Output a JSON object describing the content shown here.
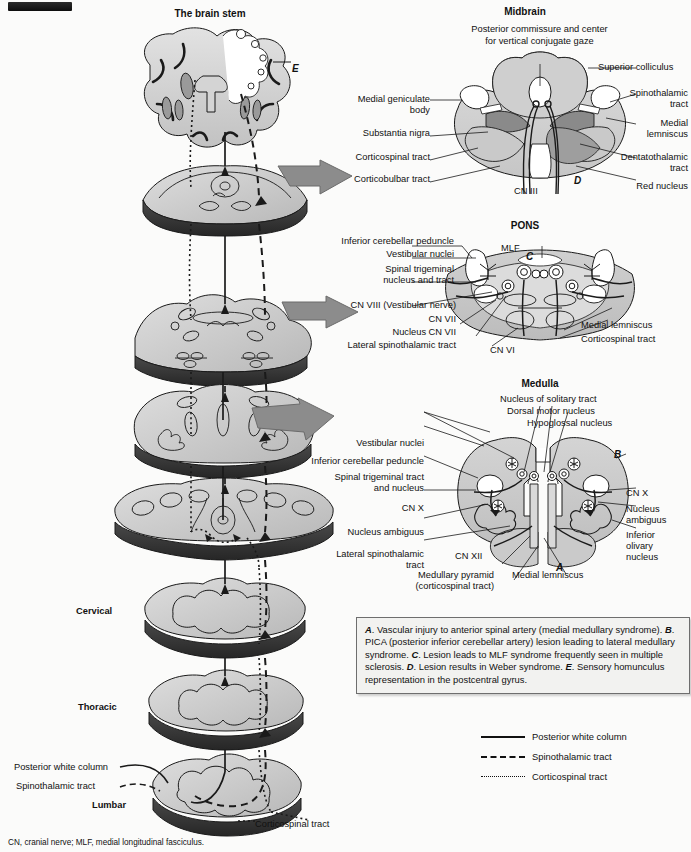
{
  "figure": {
    "brainstem_title": "The brain stem",
    "footnote": "CN, cranial nerve; MLF, medial longitudinal fasciculus."
  },
  "brainstem_column": {
    "marker_E": "E",
    "level_labels": [
      "Cervical",
      "Thoracic",
      "Lumbar"
    ],
    "tract_callouts": [
      "Posterior white column",
      "Spinothalamic tract",
      "Corticospinal tract"
    ]
  },
  "midbrain": {
    "title": "Midbrain",
    "top_label": "Posterior commissure and center\nfor vertical conjugate gaze",
    "left_labels": [
      "Medial geniculate\nbody",
      "Substantia nigra",
      "Corticospinal tract",
      "Corticobulbar tract"
    ],
    "right_labels": [
      "Superior colliculus",
      "Spinothalamic\ntract",
      "Medial\nlemniscus",
      "Dentatothalamic\ntract",
      "Red nucleus"
    ],
    "bottom_label": "CN III",
    "marker": "D"
  },
  "pons": {
    "title": "PONS",
    "left_labels": [
      "Inferior cerebellar peduncle",
      "Vestibular nuclei",
      "Spinal trigeminal\nnucleus and tract",
      "CN VIII (Vestibular nerve)",
      "CN VII",
      "Nucleus CN VII",
      "Lateral spinothalamic tract"
    ],
    "right_labels": [
      "Medial lemniscus",
      "Corticospinal tract"
    ],
    "center_labels": [
      "MLF",
      "CN VI"
    ],
    "marker": "C"
  },
  "medulla": {
    "title": "Medulla",
    "top_labels": [
      "Nucleus of solitary tract",
      "Dorsal motor nucleus",
      "Hypoglossal nucleus"
    ],
    "left_labels": [
      "Vestibular nuclei",
      "Inferior cerebellar peduncle",
      "Spinal trigeminal tract\nand nucleus",
      "CN X",
      "Nucleus ambiguus",
      "Lateral spinothalamic\ntract"
    ],
    "right_labels": [
      "CN X",
      "Nucleus\nambiguus",
      "Inferior\nolivary\nnucleus"
    ],
    "bottom_labels": [
      "CN XII",
      "Medullary pyramid\n(corticospinal tract)",
      "Medial lemniscus"
    ],
    "markers": [
      "A",
      "B"
    ]
  },
  "caption": {
    "parts": [
      {
        "mark": "A",
        "text": ". Vascular injury to anterior spinal artery (medial medullary syndrome). "
      },
      {
        "mark": "B",
        "text": ". PICA (posterior inferior cerebellar artery) lesion leading to lateral medullary syndrome. "
      },
      {
        "mark": "C",
        "text": ". Lesion leads to MLF syndrome frequently seen in multiple sclerosis. "
      },
      {
        "mark": "D",
        "text": ". Lesion results in Weber syndrome. "
      },
      {
        "mark": "E",
        "text": ". Sensory homunculus representation in the postcentral gyrus."
      }
    ]
  },
  "legend": {
    "items": [
      {
        "style": "solid",
        "label": "Posterior white column"
      },
      {
        "style": "dashed",
        "label": "Spinothalamic tract"
      },
      {
        "style": "dotted",
        "label": "Corticospinal tract"
      }
    ]
  },
  "colors": {
    "paper": "#fbfbfa",
    "tissue_light": "#d9d9d9",
    "tissue_mid": "#bdbdbd",
    "tissue_dark": "#8f8f8f",
    "tissue_darker": "#6f6f6f",
    "cord_base": "#3c3c3c",
    "arrow": "#8c8c8c",
    "stroke": "#1a1a1a"
  }
}
